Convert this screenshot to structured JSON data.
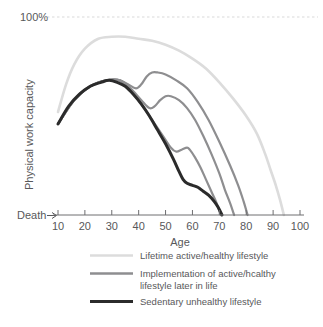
{
  "chart_data": {
    "type": "line",
    "title": "",
    "xlabel": "Age",
    "ylabel": "Physical work capacity",
    "xlim": [
      5,
      102
    ],
    "ylim": [
      0,
      100
    ],
    "xticks": [
      10,
      20,
      30,
      40,
      50,
      60,
      70,
      80,
      90,
      100
    ],
    "xtick_labels": [
      "10",
      "20",
      "30",
      "40",
      "50",
      "60",
      "70",
      "80",
      "90",
      "100"
    ],
    "ytick_labels": [
      "100%",
      "Death"
    ],
    "y_top_label": "100%",
    "y_bottom_label": "Death",
    "grid": false,
    "reference_line": {
      "value": 100,
      "label": "100%",
      "style": "dashed",
      "color": "#d9d9d9"
    },
    "legend_position": "below",
    "colors": {
      "lifetime_active": "#dcdcdc",
      "implementation": "#8e8e90",
      "sedentary": "#2b2b2b",
      "axis": "#6e6e70",
      "text": "#58585a",
      "background": "#ffffff"
    },
    "series": [
      {
        "name": "Lifetime active/healthy lifestyle",
        "color": "#dcdcdc",
        "width": 2.6,
        "points": [
          [
            10,
            52
          ],
          [
            13,
            66
          ],
          [
            16,
            76
          ],
          [
            20,
            84
          ],
          [
            25,
            89
          ],
          [
            30,
            90
          ],
          [
            35,
            90
          ],
          [
            40,
            89
          ],
          [
            45,
            88
          ],
          [
            50,
            86
          ],
          [
            55,
            83
          ],
          [
            60,
            79
          ],
          [
            65,
            74
          ],
          [
            70,
            67
          ],
          [
            75,
            59
          ],
          [
            80,
            50
          ],
          [
            84,
            41
          ],
          [
            87,
            31
          ],
          [
            89,
            23
          ],
          [
            91,
            15
          ],
          [
            92.5,
            8
          ],
          [
            94,
            0
          ]
        ]
      },
      {
        "name": "Implementation of active/hcalthy lifestyle later in life (age 40)",
        "color": "#8e8e90",
        "width": 2.2,
        "points": [
          [
            10,
            46
          ],
          [
            16,
            58
          ],
          [
            22,
            65
          ],
          [
            28,
            68
          ],
          [
            33,
            68
          ],
          [
            36,
            66
          ],
          [
            39,
            64
          ],
          [
            41,
            66
          ],
          [
            43,
            70
          ],
          [
            45,
            72
          ],
          [
            47,
            72
          ],
          [
            50,
            71
          ],
          [
            54,
            68
          ],
          [
            58,
            64
          ],
          [
            62,
            57
          ],
          [
            66,
            48
          ],
          [
            70,
            37
          ],
          [
            74,
            25
          ],
          [
            77,
            15
          ],
          [
            79,
            7
          ],
          [
            80.5,
            0
          ]
        ]
      },
      {
        "name": "Implementation of active/hcalthy lifestyle later in life (age 50)",
        "color": "#8e8e90",
        "width": 2.2,
        "points": [
          [
            10,
            46
          ],
          [
            16,
            58
          ],
          [
            22,
            65
          ],
          [
            28,
            68
          ],
          [
            33,
            68
          ],
          [
            37,
            64
          ],
          [
            41,
            58
          ],
          [
            44,
            54
          ],
          [
            46,
            55
          ],
          [
            48,
            58
          ],
          [
            50,
            60
          ],
          [
            52,
            60
          ],
          [
            55,
            58
          ],
          [
            58,
            54
          ],
          [
            61,
            48
          ],
          [
            64,
            40
          ],
          [
            67,
            31
          ],
          [
            70,
            21
          ],
          [
            72,
            13
          ],
          [
            74,
            6
          ],
          [
            75.5,
            0
          ]
        ]
      },
      {
        "name": "Implementation of active/hcalthy lifestyle later in life (age 57)",
        "color": "#8e8e90",
        "width": 2.2,
        "points": [
          [
            10,
            46
          ],
          [
            16,
            58
          ],
          [
            22,
            65
          ],
          [
            28,
            68
          ],
          [
            33,
            68
          ],
          [
            37,
            63
          ],
          [
            41,
            56
          ],
          [
            45,
            48
          ],
          [
            49,
            40
          ],
          [
            52,
            34
          ],
          [
            54,
            32
          ],
          [
            56,
            33
          ],
          [
            58,
            34
          ],
          [
            59,
            33
          ],
          [
            61,
            29
          ],
          [
            63,
            24
          ],
          [
            65,
            18
          ],
          [
            67,
            12
          ],
          [
            69,
            6
          ],
          [
            70.5,
            0
          ]
        ]
      },
      {
        "name": "Sedentary unhealthy lifestyle",
        "color": "#2b2b2b",
        "width": 3.0,
        "points": [
          [
            10,
            46
          ],
          [
            14,
            55
          ],
          [
            18,
            61
          ],
          [
            22,
            65
          ],
          [
            26,
            67
          ],
          [
            29,
            68
          ],
          [
            32,
            67
          ],
          [
            35,
            65
          ],
          [
            38,
            61
          ],
          [
            41,
            56
          ],
          [
            44,
            50
          ],
          [
            47,
            43
          ],
          [
            50,
            36
          ],
          [
            53,
            28
          ],
          [
            55,
            22
          ],
          [
            56.5,
            18
          ],
          [
            58,
            16
          ],
          [
            60,
            15
          ],
          [
            62,
            14
          ],
          [
            64,
            12
          ],
          [
            66,
            10
          ],
          [
            68,
            7
          ],
          [
            69.5,
            4
          ],
          [
            71,
            0
          ]
        ]
      }
    ]
  },
  "legend": {
    "entries": [
      {
        "label": "Lifetime active/healthy lifestyle",
        "color": "#dcdcdc",
        "width": 2.6
      },
      {
        "label": "Implementation of active/hcalthy",
        "label2": "lifestyle later in life",
        "color": "#8e8e90",
        "width": 2.6
      },
      {
        "label": "Sedentary unhealthy lifestyle",
        "color": "#2b2b2b",
        "width": 3.2
      }
    ]
  }
}
